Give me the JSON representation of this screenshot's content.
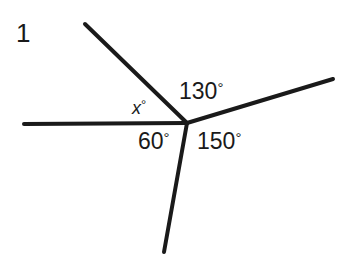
{
  "figure": {
    "item_number": "1",
    "background_color": "#ffffff",
    "stroke_color": "#1a1a1a",
    "text_color": "#1a1a1a",
    "stroke_width": 4,
    "width": 356,
    "height": 265
  },
  "vertex": {
    "x": 187,
    "y": 123
  },
  "rays": [
    {
      "name": "ray-left-horizontal",
      "x1": 24,
      "y1": 124,
      "x2": 187,
      "y2": 123
    },
    {
      "name": "ray-upper-left",
      "x1": 85,
      "y1": 24,
      "x2": 187,
      "y2": 123
    },
    {
      "name": "ray-right-upper",
      "x1": 187,
      "y1": 123,
      "x2": 333,
      "y2": 79
    },
    {
      "name": "ray-bottom",
      "x1": 187,
      "y1": 123,
      "x2": 164,
      "y2": 252
    }
  ],
  "labels": {
    "x": {
      "variable": "x",
      "degree_symbol": "°"
    },
    "a130": {
      "value": "130",
      "degree_symbol": "°"
    },
    "a60": {
      "value": "60",
      "degree_symbol": "°"
    },
    "a150": {
      "value": "150",
      "degree_symbol": "°"
    }
  },
  "chart_data": {
    "type": "diagram",
    "title": "",
    "angles": [
      {
        "label": "x°",
        "value": null,
        "unknown": true,
        "between": [
          "ray-left-horizontal",
          "ray-upper-left"
        ]
      },
      {
        "label": "130°",
        "value": 130,
        "unknown": false,
        "between": [
          "ray-upper-left",
          "ray-right-upper"
        ]
      },
      {
        "label": "150°",
        "value": 150,
        "unknown": false,
        "between": [
          "ray-right-upper",
          "ray-bottom"
        ]
      },
      {
        "label": "60°",
        "value": 60,
        "unknown": false,
        "between": [
          "ray-bottom",
          "ray-left-horizontal"
        ]
      }
    ],
    "total_degrees": 360
  }
}
